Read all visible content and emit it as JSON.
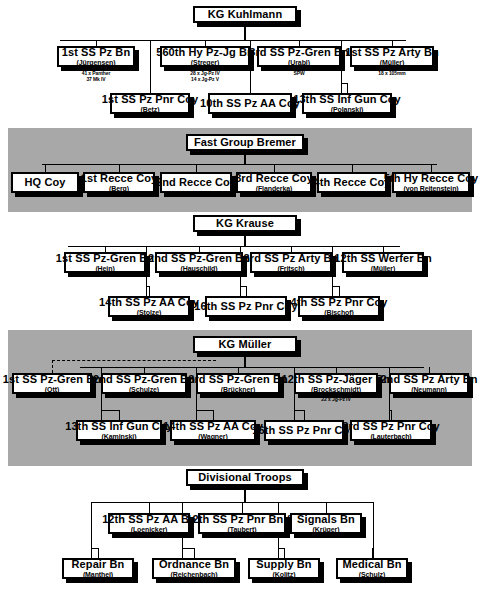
{
  "chart_data": {
    "type": "diagram",
    "groups": [
      {
        "id": "kg-kuhlmann",
        "header": "KG Kuhlmann",
        "banded": false,
        "row1": [
          {
            "l1": "1st SS Pz Bn",
            "l2": "(Jürgensen)",
            "note": "41 x Panther\n37 Mk IV"
          },
          {
            "l1": "560th Hy Pz-Jg Bn",
            "l2": "(Streger)",
            "note": "28 x Jg-Pz IV\n14 x Jg-Pz V"
          },
          {
            "l1": "3rd SS Pz-Gren Bn",
            "l2": "(Urabl)",
            "note": "SPW"
          },
          {
            "l1": "1st SS Pz Arty Bn",
            "l2": "(Müller)",
            "note": "18 x 105mm"
          }
        ],
        "row2": [
          {
            "l1": "1st SS Pz Pnr Coy",
            "l2": "(Betz)",
            "note": ""
          },
          {
            "l1": "10th SS Pz AA Coy",
            "l2": "",
            "note": ""
          },
          {
            "l1": "13th SS Inf Gun Coy",
            "l2": "(Polanski)",
            "note": ""
          }
        ]
      },
      {
        "id": "fast-group-bremer",
        "header": "Fast Group Bremer",
        "banded": true,
        "row1": [
          {
            "l1": "HQ Coy",
            "l2": "",
            "note": ""
          },
          {
            "l1": "1st Recce Coy",
            "l2": "(Berg)",
            "note": ""
          },
          {
            "l1": "2nd Recce Coy",
            "l2": "",
            "note": ""
          },
          {
            "l1": "3rd Recce Coy",
            "l2": "(Flanderka)",
            "note": ""
          },
          {
            "l1": "4th Recce Coy",
            "l2": "",
            "note": ""
          },
          {
            "l1": "5th Hy Recce Coy",
            "l2": "(von Reitenstein)",
            "note": ""
          }
        ],
        "row2": []
      },
      {
        "id": "kg-krause",
        "header": "KG Krause",
        "banded": false,
        "row1": [
          {
            "l1": "1st SS Pz-Gren Bn",
            "l2": "(Hein)",
            "note": ""
          },
          {
            "l1": "2nd SS Pz-Gren Bn",
            "l2": "(Hauschild)",
            "note": ""
          },
          {
            "l1": "3rd SS Pz Arty Bn",
            "l2": "(Fritsch)",
            "note": ""
          },
          {
            "l1": "12th SS Werfer Bn",
            "l2": "(Müller)",
            "note": ""
          }
        ],
        "row2": [
          {
            "l1": "14th SS Pz AA Coy",
            "l2": "(Stolze)",
            "note": ""
          },
          {
            "l1": "16th SS Pz Pnr Coy",
            "l2": "",
            "note": ""
          },
          {
            "l1": "4th SS Pz Pnr Coy",
            "l2": "(Bischof)",
            "note": ""
          }
        ]
      },
      {
        "id": "kg-muller",
        "header": "KG Müller",
        "banded": true,
        "row1": [
          {
            "l1": "1st SS Pz-Gren Bn",
            "l2": "(Ott)",
            "note": "",
            "attached": true
          },
          {
            "l1": "2nd SS Pz-Gren Bn",
            "l2": "(Schulze)",
            "note": ""
          },
          {
            "l1": "3rd SS Pz-Gren Bn",
            "l2": "(Brückner)",
            "note": ""
          },
          {
            "l1": "12th SS Pz-Jäger Bn",
            "l2": "(Brockschmidt)",
            "note": "22 x Jg-Pz IV"
          },
          {
            "l1": "2nd SS Pz Arty Bn",
            "l2": "(Neumann)",
            "note": ""
          }
        ],
        "row2": [
          {
            "l1": "13th SS Inf Gun Coy",
            "l2": "(Kaminski)",
            "note": ""
          },
          {
            "l1": "14th SS Pz AA Coy",
            "l2": "(Wagner)",
            "note": ""
          },
          {
            "l1": "16th SS Pz Pnr Coy",
            "l2": "",
            "note": ""
          },
          {
            "l1": "3rd SS Pz Pnr Coy",
            "l2": "(Lauterbach)",
            "note": ""
          }
        ]
      },
      {
        "id": "divisional-troops",
        "header": "Divisional Troops",
        "banded": false,
        "row1": [
          {
            "l1": "12th SS Pz AA Bn",
            "l2": "(Loenicker)",
            "note": ""
          },
          {
            "l1": "12th SS Pz Pnr Bn (-)",
            "l2": "(Taubert)",
            "note": ""
          },
          {
            "l1": "Signals Bn",
            "l2": "(Krüger)",
            "note": ""
          }
        ],
        "row2": [
          {
            "l1": "Repair Bn",
            "l2": "(Manthei)",
            "note": ""
          },
          {
            "l1": "Ordnance Bn",
            "l2": "(Reichenbach)",
            "note": ""
          },
          {
            "l1": "Supply Bn",
            "l2": "(Kolitz)",
            "note": ""
          },
          {
            "l1": "Medical Bn",
            "l2": "(Schulz)",
            "note": ""
          }
        ]
      }
    ],
    "colors": {
      "band": "#a8a8a8",
      "box_fill": "#ffffff",
      "line": "#000000"
    }
  }
}
